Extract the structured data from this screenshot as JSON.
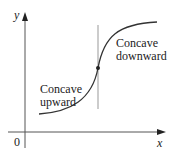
{
  "diagram": {
    "axes": {
      "x_label": "x",
      "y_label": "y",
      "origin_label": "0"
    },
    "regions": [
      {
        "name": "concave-upward",
        "line1": "Concave",
        "line2": "upward"
      },
      {
        "name": "concave-downward",
        "line1": "Concave",
        "line2": "downward"
      }
    ],
    "inflection_point": {
      "marker": "dot"
    },
    "colors": {
      "curve": "#333333",
      "axis": "#333333",
      "divider": "#999999"
    }
  }
}
